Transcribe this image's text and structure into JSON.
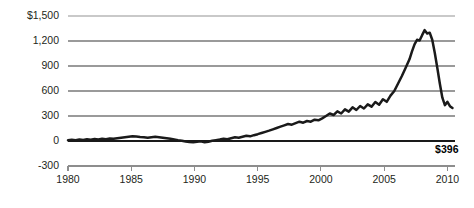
{
  "chart_data": {
    "type": "line",
    "title": "",
    "subtitle": "",
    "xlabel": "",
    "ylabel": "",
    "xlim": [
      1980,
      2010.6
    ],
    "ylim": [
      -300,
      1500
    ],
    "grid": true,
    "legend_position": "none",
    "y_ticks": [
      -300,
      0,
      300,
      600,
      900,
      1200,
      1500
    ],
    "y_tick_labels": [
      "-300",
      "0",
      "300",
      "600",
      "900",
      "1,200",
      "$1,500"
    ],
    "x_ticks": [
      1980,
      1985,
      1990,
      1995,
      2000,
      2005,
      2010
    ],
    "x_tick_labels": [
      "1980",
      "1985",
      "1990",
      "1995",
      "2000",
      "2005",
      "2010"
    ],
    "annotations": [
      {
        "name": "endpoint-value",
        "text": "$396",
        "x": 2010.4,
        "y": 396
      }
    ],
    "series": [
      {
        "name": "value",
        "color": "#1a1a1a",
        "x": [
          1980.0,
          1980.3,
          1980.6,
          1980.9,
          1981.2,
          1981.5,
          1981.8,
          1982.1,
          1982.4,
          1982.7,
          1983.0,
          1983.3,
          1983.6,
          1983.9,
          1984.2,
          1984.5,
          1984.8,
          1985.1,
          1985.4,
          1985.7,
          1986.0,
          1986.3,
          1986.6,
          1986.9,
          1987.2,
          1987.5,
          1987.8,
          1988.1,
          1988.4,
          1988.7,
          1989.0,
          1989.3,
          1989.6,
          1989.9,
          1990.2,
          1990.5,
          1990.8,
          1991.1,
          1991.4,
          1991.7,
          1992.0,
          1992.3,
          1992.6,
          1992.9,
          1993.2,
          1993.5,
          1993.8,
          1994.1,
          1994.4,
          1994.7,
          1995.0,
          1995.3,
          1995.6,
          1995.9,
          1996.2,
          1996.5,
          1996.8,
          1997.1,
          1997.4,
          1997.7,
          1998.0,
          1998.3,
          1998.6,
          1998.9,
          1999.2,
          1999.5,
          1999.8,
          2000.1,
          2000.4,
          2000.7,
          2001.0,
          2001.3,
          2001.6,
          2001.9,
          2002.2,
          2002.5,
          2002.8,
          2003.1,
          2003.4,
          2003.7,
          2004.0,
          2004.3,
          2004.6,
          2004.9,
          2005.2,
          2005.5,
          2005.8,
          2006.1,
          2006.4,
          2006.7,
          2007.0,
          2007.2,
          2007.4,
          2007.6,
          2007.8,
          2008.0,
          2008.2,
          2008.4,
          2008.6,
          2008.8,
          2009.0,
          2009.2,
          2009.4,
          2009.6,
          2009.8,
          2010.0,
          2010.2,
          2010.4
        ],
        "values": [
          8,
          14,
          10,
          18,
          12,
          20,
          16,
          24,
          18,
          26,
          22,
          30,
          26,
          34,
          40,
          46,
          52,
          58,
          54,
          48,
          44,
          38,
          44,
          50,
          46,
          40,
          34,
          26,
          18,
          10,
          4,
          -6,
          -12,
          -16,
          -10,
          -4,
          -14,
          -8,
          2,
          10,
          18,
          28,
          22,
          34,
          44,
          38,
          50,
          62,
          56,
          70,
          82,
          96,
          110,
          124,
          140,
          156,
          172,
          188,
          204,
          196,
          214,
          232,
          220,
          240,
          232,
          256,
          248,
          272,
          300,
          330,
          312,
          356,
          330,
          380,
          352,
          404,
          372,
          420,
          390,
          440,
          412,
          468,
          436,
          500,
          470,
          545,
          600,
          690,
          780,
          880,
          980,
          1075,
          1160,
          1215,
          1205,
          1270,
          1330,
          1290,
          1300,
          1215,
          1060,
          880,
          690,
          520,
          430,
          470,
          418,
          396
        ]
      }
    ]
  },
  "layout": {
    "plot_left": 68,
    "plot_right": 455,
    "plot_top": 16,
    "plot_bottom": 166,
    "axis_bottom_y": 172
  }
}
